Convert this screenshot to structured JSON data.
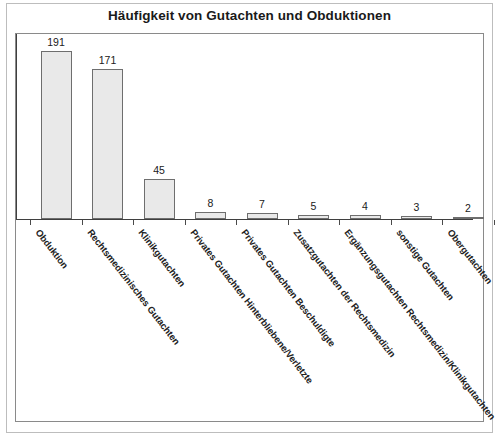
{
  "figure": {
    "title": "Häufigkeit von Gutachten und Obduktionen",
    "border_color": "#bdbdbd",
    "plot_border_color": "#8a8a8a",
    "bar_fill": "#e9e9e9",
    "bar_stroke": "#6e6e6e",
    "axis_color": "#3f3f3f",
    "background": "#ffffff"
  },
  "chart_data": {
    "type": "bar",
    "title": "Häufigkeit von Gutachten und Obduktionen",
    "xlabel": "",
    "ylabel": "",
    "categories": [
      "Obduktion",
      "Rechtsmedizinisches Gutachten",
      "Klinikgutachten",
      "Privates Gutachten Hinterbliebene/Verletzte",
      "Privates Gutachten Beschuldigte",
      "Zusatzgutachten der Rechtsmedizin",
      "Ergänzungsgutachten Rechtsmedizin/Klinikgutachten",
      "sonstige Gutachten",
      "Obergutachten"
    ],
    "values": [
      191,
      171,
      45,
      8,
      7,
      5,
      4,
      3,
      2
    ],
    "value_labels": [
      "191",
      "171",
      "45",
      "8",
      "7",
      "5",
      "4",
      "3",
      "2"
    ],
    "ylim": [
      0,
      205
    ],
    "grid": false,
    "legend": false,
    "axis_tick_labels_rotation_deg": 52,
    "series": [
      {
        "name": "Häufigkeit",
        "values": [
          191,
          171,
          45,
          8,
          7,
          5,
          4,
          3,
          2
        ]
      }
    ]
  }
}
